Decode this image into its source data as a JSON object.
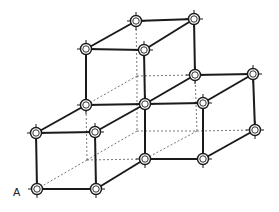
{
  "diagram": {
    "type": "crystal-lattice",
    "label_A": "A",
    "colors": {
      "line": "#1a1a1a",
      "hidden": "#555555",
      "node_fill": "#ffffff"
    },
    "nodes": [
      {
        "id": "n1",
        "x": 136,
        "y": 21
      },
      {
        "id": "n2",
        "x": 194,
        "y": 19
      },
      {
        "id": "n3",
        "x": 86,
        "y": 49
      },
      {
        "id": "n4",
        "x": 144,
        "y": 50
      },
      {
        "id": "n5",
        "x": 195,
        "y": 75
      },
      {
        "id": "n6",
        "x": 253,
        "y": 74
      },
      {
        "id": "n7",
        "x": 86,
        "y": 105
      },
      {
        "id": "n8",
        "x": 145,
        "y": 104
      },
      {
        "id": "n9",
        "x": 203,
        "y": 103
      },
      {
        "id": "n10",
        "x": 36,
        "y": 133
      },
      {
        "id": "n11",
        "x": 95,
        "y": 132
      },
      {
        "id": "n12",
        "x": 255,
        "y": 130
      },
      {
        "id": "n13",
        "x": 145,
        "y": 159
      },
      {
        "id": "n14",
        "x": 203,
        "y": 159
      },
      {
        "id": "n15",
        "x": 37,
        "y": 189
      },
      {
        "id": "n16",
        "x": 96,
        "y": 189
      }
    ],
    "edges": [
      [
        "n1",
        "n2"
      ],
      [
        "n1",
        "n3"
      ],
      [
        "n2",
        "n4"
      ],
      [
        "n3",
        "n4"
      ],
      [
        "n2",
        "n5"
      ],
      [
        "n3",
        "n7"
      ],
      [
        "n4",
        "n8"
      ],
      [
        "n5",
        "n6"
      ],
      [
        "n5",
        "n8"
      ],
      [
        "n6",
        "n9"
      ],
      [
        "n8",
        "n9"
      ],
      [
        "n7",
        "n8"
      ],
      [
        "n7",
        "n10"
      ],
      [
        "n8",
        "n11"
      ],
      [
        "n10",
        "n11"
      ],
      [
        "n6",
        "n12"
      ],
      [
        "n9",
        "n14"
      ],
      [
        "n12",
        "n14"
      ],
      [
        "n8",
        "n13"
      ],
      [
        "n13",
        "n14"
      ],
      [
        "n13",
        "n16"
      ],
      [
        "n10",
        "n15"
      ],
      [
        "n11",
        "n16"
      ],
      [
        "n15",
        "n16"
      ]
    ],
    "hidden_points": [
      {
        "id": "h1",
        "x": 137,
        "y": 76
      },
      {
        "id": "h2",
        "x": 137,
        "y": 131
      },
      {
        "id": "h3",
        "x": 197,
        "y": 131
      },
      {
        "id": "h4",
        "x": 87,
        "y": 160
      }
    ],
    "hidden_edges": [
      [
        136,
        21,
        137,
        76
      ],
      [
        137,
        76,
        137,
        131
      ],
      [
        137,
        76,
        195,
        75
      ],
      [
        137,
        76,
        86,
        105
      ],
      [
        137,
        131,
        87,
        160
      ],
      [
        137,
        131,
        197,
        131
      ],
      [
        197,
        131,
        195,
        75
      ],
      [
        197,
        131,
        255,
        130
      ],
      [
        197,
        131,
        145,
        159
      ],
      [
        87,
        160,
        86,
        105
      ],
      [
        87,
        160,
        145,
        159
      ],
      [
        87,
        160,
        37,
        189
      ]
    ]
  }
}
